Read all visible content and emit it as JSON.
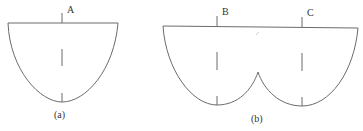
{
  "figure": {
    "stroke_color": "#6b6b6b",
    "panels": [
      {
        "id": "a",
        "caption": "(a)",
        "shape": "single-lobe bowl",
        "points": [
          {
            "label": "A"
          }
        ]
      },
      {
        "id": "b",
        "caption": "(b)",
        "shape": "double-lobe bowl with central cusp",
        "points": [
          {
            "label": "B"
          },
          {
            "label": "C"
          }
        ]
      }
    ]
  }
}
